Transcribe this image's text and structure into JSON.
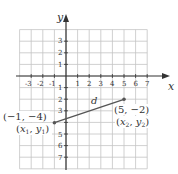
{
  "diagram": {
    "axes": {
      "x_label": "x",
      "y_label": "y",
      "x_ticks": [
        "-3",
        "-2",
        "-1",
        "1",
        "2",
        "3",
        "4",
        "5",
        "6",
        "7"
      ],
      "y_ticks_pos": [
        "3",
        "2",
        "1"
      ],
      "y_ticks_neg": [
        "1",
        "2",
        "3",
        "5",
        "6",
        "7"
      ],
      "x_range": [
        -4,
        7
      ],
      "y_range": [
        -8,
        4
      ]
    },
    "segment": {
      "label": "d",
      "color": "#555555"
    },
    "points": [
      {
        "coord_label": "(−1, −4)",
        "sub_label_x": "x",
        "sub_label_sub1": "1",
        "sub_label_y": "y",
        "sub_label_sub2": "1",
        "x": -1,
        "y": -4
      },
      {
        "coord_label": "(5, −2)",
        "sub_label_x": "x",
        "sub_label_sub1": "2",
        "sub_label_y": "y",
        "sub_label_sub2": "2",
        "x": 5,
        "y": -2
      }
    ],
    "colors": {
      "grid": "#bbbbbb",
      "axis": "#333333",
      "segment": "#555555"
    }
  }
}
